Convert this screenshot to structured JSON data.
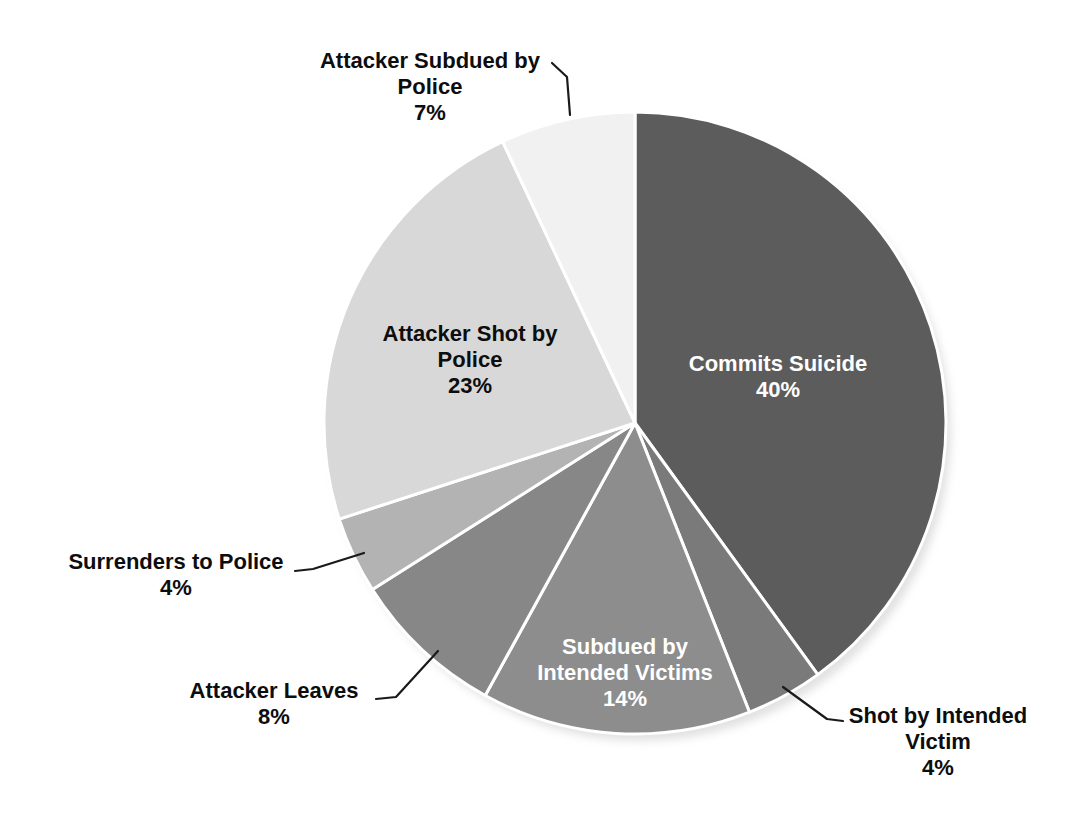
{
  "chart_data": {
    "type": "pie",
    "title": "",
    "unit": "%",
    "start_angle_deg": 0,
    "direction": "clockwise",
    "separator_color": "#ffffff",
    "categories": [
      "Commits Suicide",
      "Shot by Intended Victim",
      "Subdued by Intended Victims",
      "Attacker Leaves",
      "Surrenders to Police",
      "Attacker Shot by Police",
      "Attacker Subdued by Police"
    ],
    "values": [
      40,
      4,
      14,
      8,
      4,
      23,
      7
    ],
    "slices": [
      {
        "label": "Commits Suicide",
        "value": 40,
        "pct_label": "40%",
        "color": "#5c5c5c",
        "label_placement": "inside",
        "label_color": "#ffffff"
      },
      {
        "label": "Shot by Intended Victim",
        "value": 4,
        "pct_label": "4%",
        "color": "#7a7a7a",
        "label_placement": "outside",
        "label_color": "#0d0d0d"
      },
      {
        "label": "Subdued by Intended Victims",
        "value": 14,
        "pct_label": "14%",
        "color": "#8d8d8d",
        "label_placement": "inside",
        "label_color": "#ffffff"
      },
      {
        "label": "Attacker Leaves",
        "value": 8,
        "pct_label": "8%",
        "color": "#878787",
        "label_placement": "outside",
        "label_color": "#0d0d0d"
      },
      {
        "label": "Surrenders to Police",
        "value": 4,
        "pct_label": "4%",
        "color": "#b3b3b3",
        "label_placement": "outside",
        "label_color": "#0d0d0d"
      },
      {
        "label": "Attacker Shot by Police",
        "value": 23,
        "pct_label": "23%",
        "color": "#d8d8d8",
        "label_placement": "inside",
        "label_color": "#0d0d0d"
      },
      {
        "label": "Attacker Subdued by Police",
        "value": 7,
        "pct_label": "7%",
        "color": "#f1f1f1",
        "label_placement": "outside",
        "label_color": "#0d0d0d"
      }
    ],
    "leader_line_color": "#1a1a1a"
  }
}
